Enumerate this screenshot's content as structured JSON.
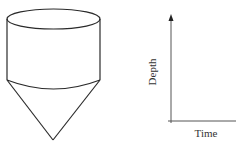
{
  "tank": {
    "shape": "cylinder-over-cone",
    "description": "Cylindrical tank with conical bottom"
  },
  "graph": {
    "x_label": "Time",
    "y_label": "Depth",
    "colors": {
      "tank_stroke": "#2a2a2a",
      "axis_stroke": "#555555",
      "label": "#333333"
    }
  }
}
